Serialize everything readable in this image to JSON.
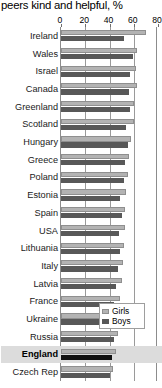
{
  "chart_data": {
    "type": "bar",
    "orientation": "horizontal",
    "title": "peers kind and helpful, %",
    "xlabel": "",
    "ylabel": "",
    "xlim": [
      0,
      80
    ],
    "xticks": [
      0,
      20,
      40,
      60,
      80
    ],
    "grid": true,
    "legend_position": "bottom-right",
    "categories": [
      "Ireland",
      "Wales",
      "Israel",
      "Canada",
      "Greenland",
      "Scotland",
      "Hungary",
      "Greece",
      "Poland",
      "Estonia",
      "Spain",
      "USA",
      "Lithuania",
      "Italy",
      "Latvia",
      "France",
      "Ukraine",
      "Russia",
      "England",
      "Czech Rep"
    ],
    "series": [
      {
        "name": "Girls",
        "color": "#b3b3b3",
        "values": [
          70,
          63,
          62,
          63,
          60,
          60,
          58,
          56,
          55,
          54,
          53,
          53,
          52,
          51,
          50,
          49,
          48,
          47,
          45,
          43
        ]
      },
      {
        "name": "Boys",
        "color": "#585858",
        "values": [
          52,
          59,
          57,
          56,
          57,
          54,
          55,
          53,
          52,
          49,
          50,
          48,
          49,
          47,
          45,
          44,
          46,
          44,
          42,
          40
        ]
      }
    ],
    "highlighted_category": "England"
  },
  "legend": {
    "items": [
      {
        "label": "Girls"
      },
      {
        "label": "Boys"
      }
    ]
  },
  "colors": {
    "girls": "#b3b3b3",
    "boys": "#585858",
    "highlight_band": "#dcdcdc",
    "highlight_bar": "#111111",
    "axis": "#8c8c8c",
    "gridline": "#9a9a9a"
  }
}
